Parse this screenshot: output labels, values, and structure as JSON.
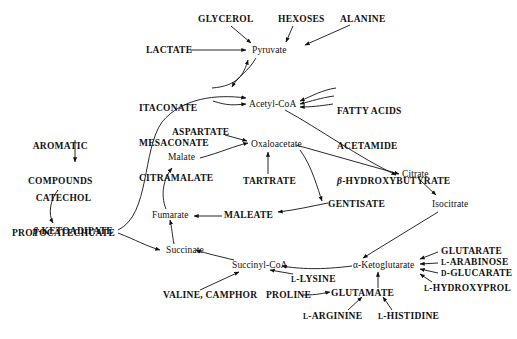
{
  "diagram": {
    "type": "metabolic-pathway-map",
    "title": "",
    "nodes": [
      {
        "id": "glycerol",
        "label": "GLYCEROL",
        "kind": "substrate",
        "x": 198,
        "y": 14
      },
      {
        "id": "hexoses",
        "label": "HEXOSES",
        "kind": "substrate",
        "x": 278,
        "y": 14
      },
      {
        "id": "alanine",
        "label": "ALANINE",
        "kind": "substrate",
        "x": 340,
        "y": 14
      },
      {
        "id": "lactate",
        "label": "LACTATE",
        "kind": "substrate",
        "x": 146,
        "y": 46
      },
      {
        "id": "pyruvate",
        "label": "Pyruvate",
        "kind": "intermediate",
        "x": 252,
        "y": 47
      },
      {
        "id": "itaconate_group",
        "label": "ITACONATE\nMESACONATE\nCITRAMALATE",
        "kind": "substrate",
        "x": 139,
        "y": 80
      },
      {
        "id": "acetyl_coa",
        "label": "Acetyl-CoA",
        "kind": "intermediate",
        "x": 252,
        "y": 100
      },
      {
        "id": "fatty_group",
        "label": "FATTY ACIDS\nACETAMIDE\nβ-HYDROXYBUTYRATE",
        "kind": "substrate",
        "x": 337,
        "y": 83
      },
      {
        "id": "aromatic",
        "label": "AROMATIC\nCOMPOUNDS",
        "kind": "substrate",
        "x": 44,
        "y": 118
      },
      {
        "id": "aspartate",
        "label": "ASPARTATE",
        "kind": "substrate",
        "x": 172,
        "y": 128
      },
      {
        "id": "oxaloacetate",
        "label": "Oxaloacetate",
        "kind": "intermediate",
        "x": 253,
        "y": 140
      },
      {
        "id": "catechol",
        "label": "CATECHOL\nPROTOCATECHUATE",
        "kind": "substrate",
        "x": 30,
        "y": 170
      },
      {
        "id": "malate",
        "label": "Malate",
        "kind": "intermediate",
        "x": 170,
        "y": 157
      },
      {
        "id": "citrate",
        "label": "Citrate",
        "kind": "intermediate",
        "x": 404,
        "y": 170
      },
      {
        "id": "tartrate",
        "label": "TARTRATE",
        "kind": "substrate",
        "x": 246,
        "y": 177
      },
      {
        "id": "isocitrate",
        "label": "Isocitrate",
        "kind": "intermediate",
        "x": 434,
        "y": 200
      },
      {
        "id": "gentisate",
        "label": "GENTISATE",
        "kind": "substrate",
        "x": 330,
        "y": 200
      },
      {
        "id": "fumarate",
        "label": "Fumarate",
        "kind": "intermediate",
        "x": 153,
        "y": 212
      },
      {
        "id": "maleate",
        "label": "MALEATE",
        "kind": "substrate",
        "x": 226,
        "y": 212
      },
      {
        "id": "ketoadipate",
        "label": "β-KETOADIPATE",
        "kind": "substrate",
        "x": 33,
        "y": 228
      },
      {
        "id": "succinate",
        "label": "Succinate",
        "kind": "intermediate",
        "x": 168,
        "y": 247
      },
      {
        "id": "succinyl_coa",
        "label": "Succinyl-CoA",
        "kind": "intermediate",
        "x": 234,
        "y": 262
      },
      {
        "id": "ketoglutarate",
        "label": "α-Ketoglutarate",
        "kind": "intermediate",
        "x": 355,
        "y": 262
      },
      {
        "id": "glutarate",
        "label": "GLUTARATE",
        "kind": "substrate",
        "x": 441,
        "y": 248
      },
      {
        "id": "arabinose",
        "label": "L-ARABINOSE",
        "kind": "substrate",
        "x": 441,
        "y": 259
      },
      {
        "id": "glucarate",
        "label": "D-GLUCARATE",
        "kind": "substrate",
        "x": 441,
        "y": 270
      },
      {
        "id": "lysine",
        "label": "L-LYSINE",
        "kind": "substrate",
        "x": 291,
        "y": 276
      },
      {
        "id": "hydroxyproline",
        "label": "L-HYDROXYPROL",
        "kind": "substrate",
        "x": 424,
        "y": 285
      },
      {
        "id": "valine_camphor",
        "label": "VALINE, CAMPHOR",
        "kind": "substrate",
        "x": 163,
        "y": 292
      },
      {
        "id": "proline",
        "label": "PROLINE",
        "kind": "substrate",
        "x": 266,
        "y": 292
      },
      {
        "id": "glutamate",
        "label": "GLUTAMATE",
        "kind": "substrate",
        "x": 333,
        "y": 290
      },
      {
        "id": "arginine",
        "label": "L-ARGININE",
        "kind": "substrate",
        "x": 303,
        "y": 313
      },
      {
        "id": "histidine",
        "label": "L-HISTIDINE",
        "kind": "substrate",
        "x": 378,
        "y": 313
      }
    ],
    "edges": [
      {
        "from": "lactate",
        "to": "pyruvate"
      },
      {
        "from": "glycerol",
        "to": "pyruvate"
      },
      {
        "from": "hexoses",
        "to": "pyruvate"
      },
      {
        "from": "alanine",
        "to": "pyruvate"
      },
      {
        "from": "itaconate_group",
        "to": "pyruvate"
      },
      {
        "from": "itaconate_group",
        "to": "acetyl_coa"
      },
      {
        "from": "pyruvate",
        "to": "acetyl_coa"
      },
      {
        "from": "fatty_group",
        "to": "acetyl_coa"
      },
      {
        "from": "acetyl_coa",
        "to": "citrate"
      },
      {
        "from": "oxaloacetate",
        "to": "citrate"
      },
      {
        "from": "citrate",
        "to": "isocitrate"
      },
      {
        "from": "isocitrate",
        "to": "ketoglutarate"
      },
      {
        "from": "ketoglutarate",
        "to": "succinyl_coa"
      },
      {
        "from": "succinyl_coa",
        "to": "succinate"
      },
      {
        "from": "succinate",
        "to": "fumarate"
      },
      {
        "from": "fumarate",
        "to": "malate"
      },
      {
        "from": "malate",
        "to": "oxaloacetate"
      },
      {
        "from": "aspartate",
        "to": "oxaloacetate"
      },
      {
        "from": "tartrate",
        "to": "oxaloacetate"
      },
      {
        "from": "oxaloacetate",
        "to": "gentisate"
      },
      {
        "from": "gentisate",
        "to": "maleate"
      },
      {
        "from": "maleate",
        "to": "fumarate"
      },
      {
        "from": "aromatic",
        "to": "catechol"
      },
      {
        "from": "catechol",
        "to": "ketoadipate"
      },
      {
        "from": "ketoadipate",
        "to": "succinate"
      },
      {
        "from": "ketoadipate",
        "to": "acetyl_coa"
      },
      {
        "from": "valine_camphor",
        "to": "succinyl_coa"
      },
      {
        "from": "lysine",
        "to": "succinyl_coa"
      },
      {
        "from": "glutamate",
        "to": "ketoglutarate"
      },
      {
        "from": "proline",
        "to": "glutamate"
      },
      {
        "from": "arginine",
        "to": "glutamate"
      },
      {
        "from": "histidine",
        "to": "glutamate"
      },
      {
        "from": "glutarate",
        "to": "ketoglutarate"
      },
      {
        "from": "arabinose",
        "to": "ketoglutarate"
      },
      {
        "from": "glucarate",
        "to": "ketoglutarate"
      },
      {
        "from": "hydroxyproline",
        "to": "ketoglutarate"
      }
    ],
    "colors": {
      "ink": "#111111",
      "background": "#ffffff"
    }
  }
}
